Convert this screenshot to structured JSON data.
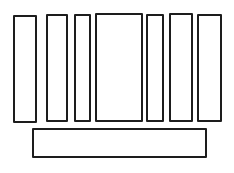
{
  "canvas": {
    "width": 234,
    "height": 173,
    "background_color": "#ffffff",
    "stroke_color": "#1d1d1d",
    "stroke_width": 2
  },
  "figure": {
    "vertical_bars": [
      {
        "x": 13,
        "y": 15,
        "width": 24,
        "height": 108
      },
      {
        "x": 46,
        "y": 14,
        "width": 22,
        "height": 108
      },
      {
        "x": 74,
        "y": 14,
        "width": 17,
        "height": 108
      },
      {
        "x": 95,
        "y": 13,
        "width": 48,
        "height": 109
      },
      {
        "x": 146,
        "y": 14,
        "width": 18,
        "height": 108
      },
      {
        "x": 169,
        "y": 13,
        "width": 24,
        "height": 109
      },
      {
        "x": 197,
        "y": 14,
        "width": 25,
        "height": 108
      }
    ],
    "horizontal_bar": {
      "x": 32,
      "y": 128,
      "width": 175,
      "height": 30
    }
  }
}
